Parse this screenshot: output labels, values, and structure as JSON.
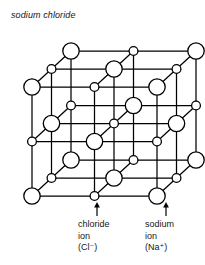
{
  "figure": {
    "title": "sodium chloride",
    "type": "crystal-lattice-diagram",
    "projection": "oblique",
    "lattice": {
      "dimensions": [
        3,
        3,
        3
      ],
      "cell_count": 2,
      "description": "face-centred cubic rock-salt lattice, alternating ions"
    },
    "ions": {
      "chloride": {
        "label_lines": [
          "chloride",
          "ion",
          "(Cl⁻)"
        ],
        "name": "chloride ion",
        "formula": "Cl⁻",
        "marker": "large-circle",
        "radius_px": 8.2,
        "parity": "even",
        "fill": "#ffffff",
        "stroke": "#000000"
      },
      "sodium": {
        "label_lines": [
          "sodium",
          "ion",
          "(Na⁺)"
        ],
        "name": "sodium ion",
        "formula": "Na⁺",
        "marker": "small-circle",
        "radius_px": 4.4,
        "parity": "odd",
        "fill": "#ffffff",
        "stroke": "#000000"
      }
    },
    "colors": {
      "background": "#ffffff",
      "bond": "#000000",
      "text": "#161616"
    },
    "geometry": {
      "origin": [
        32,
        196
      ],
      "step_x": 62.5,
      "step_y": -54.5,
      "depth_dx": 19.5,
      "depth_dy": -18.0,
      "bond_width": 1.25,
      "node_stroke_width": 1.3
    },
    "pointers": [
      {
        "name": "chloride-pointer",
        "x": 97,
        "tip_y": 202,
        "tail_y": 216
      },
      {
        "name": "sodium-pointer",
        "x": 166,
        "tip_y": 202,
        "tail_y": 216
      }
    ]
  }
}
